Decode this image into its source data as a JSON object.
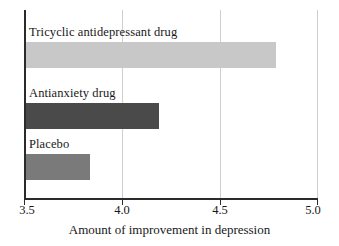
{
  "chart_data": {
    "type": "bar",
    "orientation": "horizontal",
    "title": "",
    "xlabel": "Amount of improvement in depression",
    "ylabel": "",
    "categories": [
      "Tricyclic antidepressant drug",
      "Antianxiety drug",
      "Placebo"
    ],
    "values": [
      4.79,
      4.19,
      3.84
    ],
    "series": [
      {
        "name": "Amount of improvement in depression",
        "values": [
          4.79,
          4.19,
          3.84
        ]
      }
    ],
    "bar_colors": [
      "#c8c8c8",
      "#4a4a4a",
      "#7a7a7a"
    ],
    "xlim": [
      3.5,
      5.0
    ],
    "xticks": [
      3.5,
      4.0,
      4.5,
      5.0
    ],
    "xtick_labels": [
      "3.5",
      "4.0",
      "4.5",
      "5.0"
    ],
    "gridlines": [
      4.0,
      4.5
    ],
    "grid": true,
    "legend": false,
    "legend_position": "none",
    "axis_color": "#2b2b2b",
    "grid_color": "#cfcfcf",
    "background": "#ffffff"
  },
  "axis": {
    "x_title": "Amount of improvement in depression",
    "tick_0": "3.5",
    "tick_1": "4.0",
    "tick_2": "4.5",
    "tick_3": "5.0"
  },
  "bars": {
    "bar_0_label": "Tricyclic antidepressant drug",
    "bar_1_label": "Antianxiety drug",
    "bar_2_label": "Placebo"
  }
}
